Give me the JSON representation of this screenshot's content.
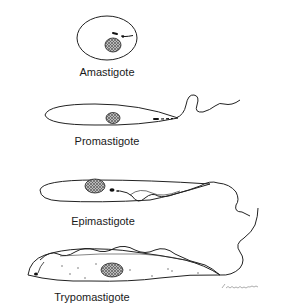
{
  "figure": {
    "stages": [
      {
        "name": "Amastigote",
        "label_x": 107,
        "label_y": 66
      },
      {
        "name": "Promastigote",
        "label_x": 107,
        "label_y": 135
      },
      {
        "name": "Epimastigote",
        "label_x": 103,
        "label_y": 215
      },
      {
        "name": "Trypomastigote",
        "label_x": 92,
        "label_y": 291
      }
    ],
    "signature": "illustrator signature"
  },
  "colors": {
    "line": "#222222",
    "nucleus_fill": "#555555",
    "background": "#ffffff"
  }
}
